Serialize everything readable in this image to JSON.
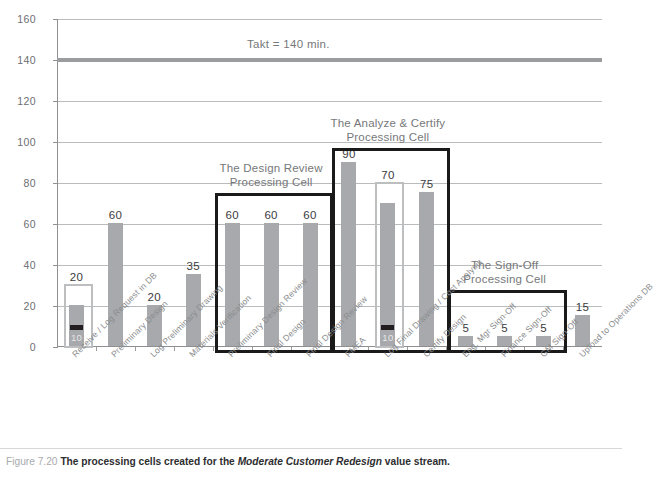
{
  "figure": {
    "number": "Figure 7.20",
    "text_before": "The processing cells created for the",
    "emphasis": "Moderate Customer Redesign",
    "text_after": "value stream."
  },
  "chart_data": {
    "type": "bar",
    "title": "",
    "xlabel": "",
    "ylabel": "",
    "ylim": [
      0,
      160
    ],
    "ytick_step": 20,
    "yticks": [
      "0",
      "20",
      "40",
      "60",
      "80",
      "100",
      "120",
      "140",
      "160"
    ],
    "grid": true,
    "legend": "none",
    "categories": [
      "Receive / Log Request in DB",
      "Preliminary Design",
      "Log Preliminary Drawing",
      "Materials Verification",
      "Preliminary Design Review",
      "Final Design",
      "Final Design Review",
      "FMEA",
      "Log Final Drawing / Cost Analysis",
      "Certify Design",
      "Eng. Mgr Sign-Off",
      "Finance Sign-Off",
      "GM Sign-Off",
      "Upload to Operations DB"
    ],
    "values": [
      20,
      60,
      20,
      35,
      60,
      60,
      60,
      90,
      70,
      75,
      5,
      5,
      5,
      15
    ],
    "value_labels": [
      "20",
      "60",
      "20",
      "35",
      "60",
      "60",
      "60",
      "90",
      "70",
      "75",
      "5",
      "5",
      "5",
      "15"
    ],
    "highlighted_bars": [
      {
        "index": 0,
        "sub_value": 10,
        "sub_label": "10"
      },
      {
        "index": 8,
        "sub_value": 10,
        "sub_label": "10"
      }
    ],
    "reference_line": {
      "value": 140,
      "label": "Takt = 140 min."
    },
    "annotations": [
      {
        "label": "The Design Review\nProcessing Cell",
        "line1": "The Design Review",
        "line2": "Processing Cell",
        "from_index": 4,
        "to_index": 6
      },
      {
        "label": "The Analyze & Certify\nProcessing Cell",
        "line1": "The Analyze & Certify",
        "line2": "Processing Cell",
        "from_index": 7,
        "to_index": 9
      },
      {
        "label": "The Sign-Off\nProcessing Cell",
        "line1": "The Sign-Off",
        "line2": "Processing Cell",
        "from_index": 10,
        "to_index": 12
      }
    ],
    "colors": {
      "bar": "#a7a9ac",
      "grid": "#b9bbbd",
      "takt": "#9a9c9e",
      "cell_box": "#1a1a1a",
      "highlight_box": "#bcbec0",
      "band": "#231f20"
    }
  }
}
